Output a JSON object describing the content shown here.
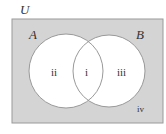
{
  "diagram": {
    "type": "venn",
    "universe_label": "U",
    "sets": [
      {
        "label": "A"
      },
      {
        "label": "B"
      }
    ],
    "regions": [
      {
        "id": "i",
        "label": "i",
        "description": "A and B"
      },
      {
        "id": "ii",
        "label": "ii",
        "description": "A only"
      },
      {
        "id": "iii",
        "label": "iii",
        "description": "B only"
      },
      {
        "id": "iv",
        "label": "iv",
        "description": "outside A and B"
      }
    ],
    "colors": {
      "universe_fill": "#d4d4d4",
      "circle_fill": "#ffffff",
      "stroke": "#9a9a9a",
      "text": "#333333"
    }
  }
}
